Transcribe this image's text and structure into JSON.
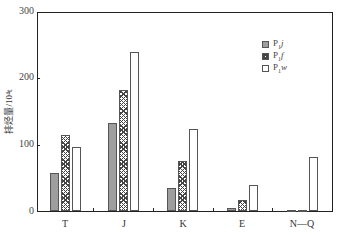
{
  "chart_data": {
    "type": "bar",
    "title": "",
    "xlabel": "",
    "ylabel": "排烃量/10⁴t",
    "ylim": [
      0,
      300
    ],
    "yticks": [
      0,
      100,
      200,
      300
    ],
    "grid": false,
    "legend_position": "upper right",
    "categories": [
      "T",
      "J",
      "K",
      "E",
      "N—Q"
    ],
    "series": [
      {
        "name": "P₁j",
        "pattern": "solid-gray",
        "values": [
          58,
          132,
          34,
          4,
          2
        ]
      },
      {
        "name": "P₁f",
        "pattern": "crosshatch",
        "values": [
          115,
          183,
          75,
          16,
          2
        ]
      },
      {
        "name": "P₁w",
        "pattern": "white",
        "values": [
          96,
          239,
          123,
          39,
          81
        ]
      }
    ]
  },
  "legend": [
    {
      "base": "P",
      "sub": "1",
      "suffix": "j"
    },
    {
      "base": "P",
      "sub": "1",
      "suffix": "f"
    },
    {
      "base": "P",
      "sub": "1",
      "suffix": "w"
    }
  ],
  "axis": {
    "ylabel": "排烃量/10⁴t",
    "ytick_labels": [
      "300",
      "200",
      "100",
      "0"
    ],
    "xtick_labels": [
      "T",
      "J",
      "K",
      "E",
      "N—Q"
    ]
  }
}
